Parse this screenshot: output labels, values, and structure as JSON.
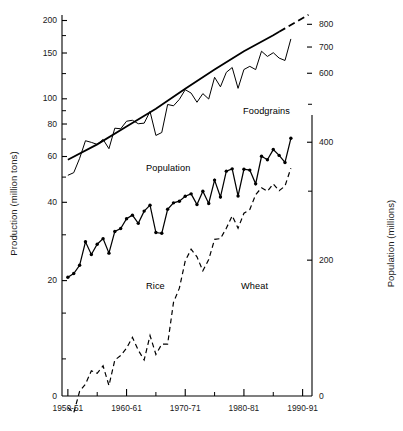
{
  "chart_data": {
    "type": "line",
    "title": "",
    "xlabel": "",
    "ylabel": "Production (million tons)",
    "y2label": "Population (millions)",
    "yscale": "log",
    "y2scale": "log",
    "ylim": [
      7,
      210
    ],
    "y2lim": [
      90,
      840
    ],
    "xlim": [
      1950,
      1991
    ],
    "grid": false,
    "legend": "inline-annotations",
    "x_tick_labels": [
      "1950-51",
      "1960-61",
      "1970-71",
      "1980-81",
      "1990-91"
    ],
    "x_tick_values": [
      1950,
      1960,
      1970,
      1980,
      1990
    ],
    "y_tick_labels": [
      "200",
      "150",
      "100",
      "80",
      "60",
      "40",
      "20",
      "0"
    ],
    "y_tick_values": [
      200,
      150,
      100,
      80,
      60,
      40,
      20,
      0
    ],
    "y2_tick_labels": [
      "800",
      "700",
      "600",
      "400",
      "200",
      "0"
    ],
    "y2_tick_values": [
      800,
      700,
      600,
      400,
      200,
      0
    ],
    "series": [
      {
        "name": "Foodgrains",
        "axis": "left",
        "style": "solid-thin",
        "markers": false,
        "x": [
          1950,
          1951,
          1952,
          1953,
          1954,
          1955,
          1956,
          1957,
          1958,
          1959,
          1960,
          1961,
          1962,
          1963,
          1964,
          1965,
          1966,
          1967,
          1968,
          1969,
          1970,
          1971,
          1972,
          1973,
          1974,
          1975,
          1976,
          1977,
          1978,
          1979,
          1980,
          1981,
          1982,
          1983,
          1984,
          1985,
          1986,
          1987,
          1988
        ],
        "values": [
          50.8,
          52.0,
          59.0,
          69.0,
          68.0,
          66.8,
          69.8,
          64.3,
          77.1,
          76.7,
          82.0,
          82.7,
          80.2,
          80.6,
          89.4,
          72.3,
          74.2,
          95.1,
          94.0,
          99.5,
          108.4,
          105.2,
          97.0,
          104.7,
          99.8,
          121.0,
          111.2,
          126.4,
          131.9,
          109.7,
          129.6,
          133.3,
          129.5,
          152.4,
          145.5,
          150.4,
          143.4,
          140.4,
          169.9
        ]
      },
      {
        "name": "Population",
        "axis": "right",
        "style": "solid-thick-then-dashed",
        "markers": false,
        "x": [
          1950,
          1955,
          1960,
          1965,
          1970,
          1975,
          1980,
          1985,
          1987,
          1991
        ],
        "values": [
          361,
          395,
          439,
          487,
          548,
          613,
          683,
          750,
          781,
          846
        ],
        "dash_start_year": 1986
      },
      {
        "name": "Rice",
        "axis": "left",
        "style": "solid-marker",
        "markers": true,
        "x": [
          1950,
          1951,
          1952,
          1953,
          1954,
          1955,
          1956,
          1957,
          1958,
          1959,
          1960,
          1961,
          1962,
          1963,
          1964,
          1965,
          1966,
          1967,
          1968,
          1969,
          1970,
          1971,
          1972,
          1973,
          1974,
          1975,
          1976,
          1977,
          1978,
          1979,
          1980,
          1981,
          1982,
          1983,
          1984,
          1985,
          1986,
          1987,
          1988
        ],
        "values": [
          20.6,
          21.3,
          22.9,
          28.2,
          25.2,
          27.6,
          29.0,
          25.5,
          30.9,
          31.7,
          34.6,
          35.7,
          33.2,
          37.0,
          39.0,
          30.6,
          30.4,
          37.6,
          39.8,
          40.4,
          42.2,
          43.1,
          39.2,
          44.1,
          39.6,
          48.7,
          41.9,
          52.7,
          53.8,
          42.3,
          53.6,
          53.2,
          47.1,
          60.1,
          58.3,
          63.8,
          60.6,
          56.9,
          70.5
        ]
      },
      {
        "name": "Wheat",
        "axis": "left",
        "style": "dashed",
        "markers": false,
        "x": [
          1950,
          1951,
          1952,
          1953,
          1954,
          1955,
          1956,
          1957,
          1958,
          1959,
          1960,
          1961,
          1962,
          1963,
          1964,
          1965,
          1966,
          1967,
          1968,
          1969,
          1970,
          1971,
          1972,
          1973,
          1974,
          1975,
          1976,
          1977,
          1978,
          1979,
          1980,
          1981,
          1982,
          1983,
          1984,
          1985,
          1986,
          1987,
          1988
        ],
        "values": [
          6.5,
          6.2,
          7.5,
          8.0,
          9.0,
          8.8,
          9.4,
          7.9,
          9.9,
          10.3,
          11.0,
          12.1,
          10.8,
          9.9,
          12.3,
          10.4,
          11.4,
          11.4,
          16.5,
          18.7,
          23.8,
          26.4,
          24.7,
          21.8,
          24.1,
          28.8,
          29.0,
          31.8,
          35.5,
          31.8,
          36.3,
          37.5,
          42.8,
          45.5,
          44.1,
          47.1,
          44.3,
          46.2,
          54.1
        ]
      }
    ]
  },
  "annotations": [
    {
      "id": "foodgrains",
      "label": "Foodgrains",
      "pointer": "pointer-hand-icon"
    },
    {
      "id": "population",
      "label": "Population",
      "pointer": "pointer-hand-icon"
    },
    {
      "id": "rice",
      "label": "Rice",
      "pointer": "pointer-hand-icon"
    },
    {
      "id": "wheat",
      "label": "Wheat",
      "pointer": "pointer-hand-icon"
    }
  ],
  "axes": {
    "left": {
      "title": "Production (million tons)",
      "ticks": [
        "200",
        "150",
        "100",
        "80",
        "60",
        "40",
        "20",
        "0"
      ]
    },
    "right": {
      "title": "Population (millions)",
      "ticks": [
        "800",
        "700",
        "600",
        "400",
        "200",
        "0"
      ]
    },
    "bottom": {
      "ticks": [
        "1950-51",
        "1960-61",
        "1970-71",
        "1980-81",
        "1990-91"
      ]
    }
  },
  "colors": {
    "ink": "#000000",
    "background": "#ffffff"
  }
}
